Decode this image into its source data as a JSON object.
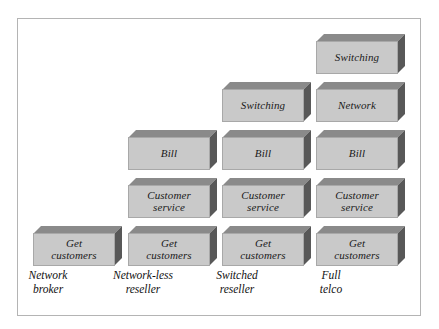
{
  "figure": {
    "type": "stacked-blocks-staircase",
    "background_color": "#ffffff",
    "frame_color": "#b4b4b4",
    "block_face_color": "#c9c9c9",
    "block_top_color": "#8a8a8a",
    "block_side_color": "#585858",
    "text_color": "#1a1a1a"
  },
  "columns": [
    {
      "caption_lines": [
        "Network",
        "broker"
      ],
      "caption_text": "Network broker",
      "left": 33,
      "caption_left": -7,
      "blocks": [
        {
          "lines": [
            "Get",
            "customers"
          ],
          "text": "Get customers"
        }
      ]
    },
    {
      "caption_lines": [
        "Network-less",
        "reseller"
      ],
      "caption_text": "Network-less reseller",
      "left": 128,
      "caption_left": 88,
      "blocks": [
        {
          "lines": [
            "Get",
            "customers"
          ],
          "text": "Get customers"
        },
        {
          "lines": [
            "Customer",
            "service"
          ],
          "text": "Customer service"
        },
        {
          "lines": [
            "Bill"
          ],
          "text": "Bill"
        }
      ]
    },
    {
      "caption_lines": [
        "Switched",
        "reseller"
      ],
      "caption_text": "Switched reseller",
      "left": 222,
      "caption_left": 182,
      "blocks": [
        {
          "lines": [
            "Get",
            "customers"
          ],
          "text": "Get customers"
        },
        {
          "lines": [
            "Customer",
            "service"
          ],
          "text": "Customer service"
        },
        {
          "lines": [
            "Bill"
          ],
          "text": "Bill"
        },
        {
          "lines": [
            "Switching"
          ],
          "text": "Switching"
        }
      ]
    },
    {
      "caption_lines": [
        "Full",
        "telco"
      ],
      "caption_text": "Full telco",
      "left": 316,
      "caption_left": 276,
      "blocks": [
        {
          "lines": [
            "Get",
            "customers"
          ],
          "text": "Get customers"
        },
        {
          "lines": [
            "Customer",
            "service"
          ],
          "text": "Customer service"
        },
        {
          "lines": [
            "Bill"
          ],
          "text": "Bill"
        },
        {
          "lines": [
            "Network"
          ],
          "text": "Network"
        },
        {
          "lines": [
            "Switching"
          ],
          "text": "Switching"
        }
      ]
    }
  ],
  "layout": {
    "block_height": 40,
    "block_step": 48,
    "stack_bottom": 63,
    "caption_top": 268
  }
}
